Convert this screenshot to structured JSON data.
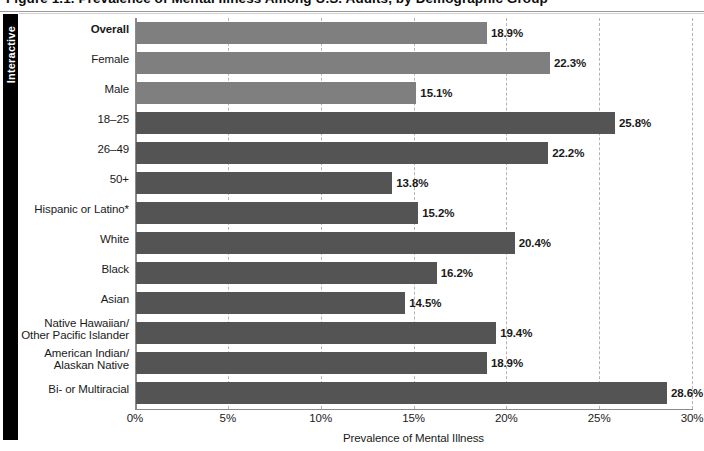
{
  "figure": {
    "caption": "Figure 1.1. Prevalence of Mental Illness Among U.S. Adults, by Demographic Group"
  },
  "sidebar": {
    "tab_label": "Interactive"
  },
  "chart_data": {
    "type": "bar",
    "orientation": "horizontal",
    "title": "",
    "xlabel": "Prevalence of Mental Illness",
    "ylabel": "",
    "xlim": [
      0,
      30
    ],
    "xtick_labels": [
      "0%",
      "5%",
      "10%",
      "15%",
      "20%",
      "25%",
      "30%"
    ],
    "xticks": [
      0,
      5,
      10,
      15,
      20,
      25,
      30
    ],
    "grid": true,
    "legend": "none",
    "categories": [
      "Overall",
      "Female",
      "Male",
      "18–25",
      "26–49",
      "50+",
      "Hispanic or Latino*",
      "White",
      "Black",
      "Asian",
      "Native Hawaiian/\nOther Pacific Islander",
      "American Indian/\nAlaskan Native",
      "Bi- or Multiracial"
    ],
    "values": [
      18.9,
      22.3,
      15.1,
      25.8,
      22.2,
      13.8,
      15.2,
      20.4,
      16.2,
      14.5,
      19.4,
      18.9,
      28.6
    ],
    "value_labels": [
      "18.9%",
      "22.3%",
      "15.1%",
      "25.8%",
      "22.2%",
      "13.8%",
      "15.2%",
      "20.4%",
      "16.2%",
      "14.5%",
      "19.4%",
      "18.9%",
      "28.6%"
    ],
    "bar_colors": [
      "#7f7f7f",
      "#7f7f7f",
      "#7f7f7f",
      "#545454",
      "#545454",
      "#545454",
      "#545454",
      "#545454",
      "#545454",
      "#545454",
      "#545454",
      "#545454",
      "#545454"
    ],
    "bold_categories": [
      "Overall"
    ],
    "colors": {
      "bar_light": "#7f7f7f",
      "bar_dark": "#545454",
      "axis": "#8a8a8a",
      "gridline": "#b4b4b4",
      "text": "#1a1a1a",
      "tab_background": "#000000",
      "tab_text": "#ffffff"
    }
  }
}
